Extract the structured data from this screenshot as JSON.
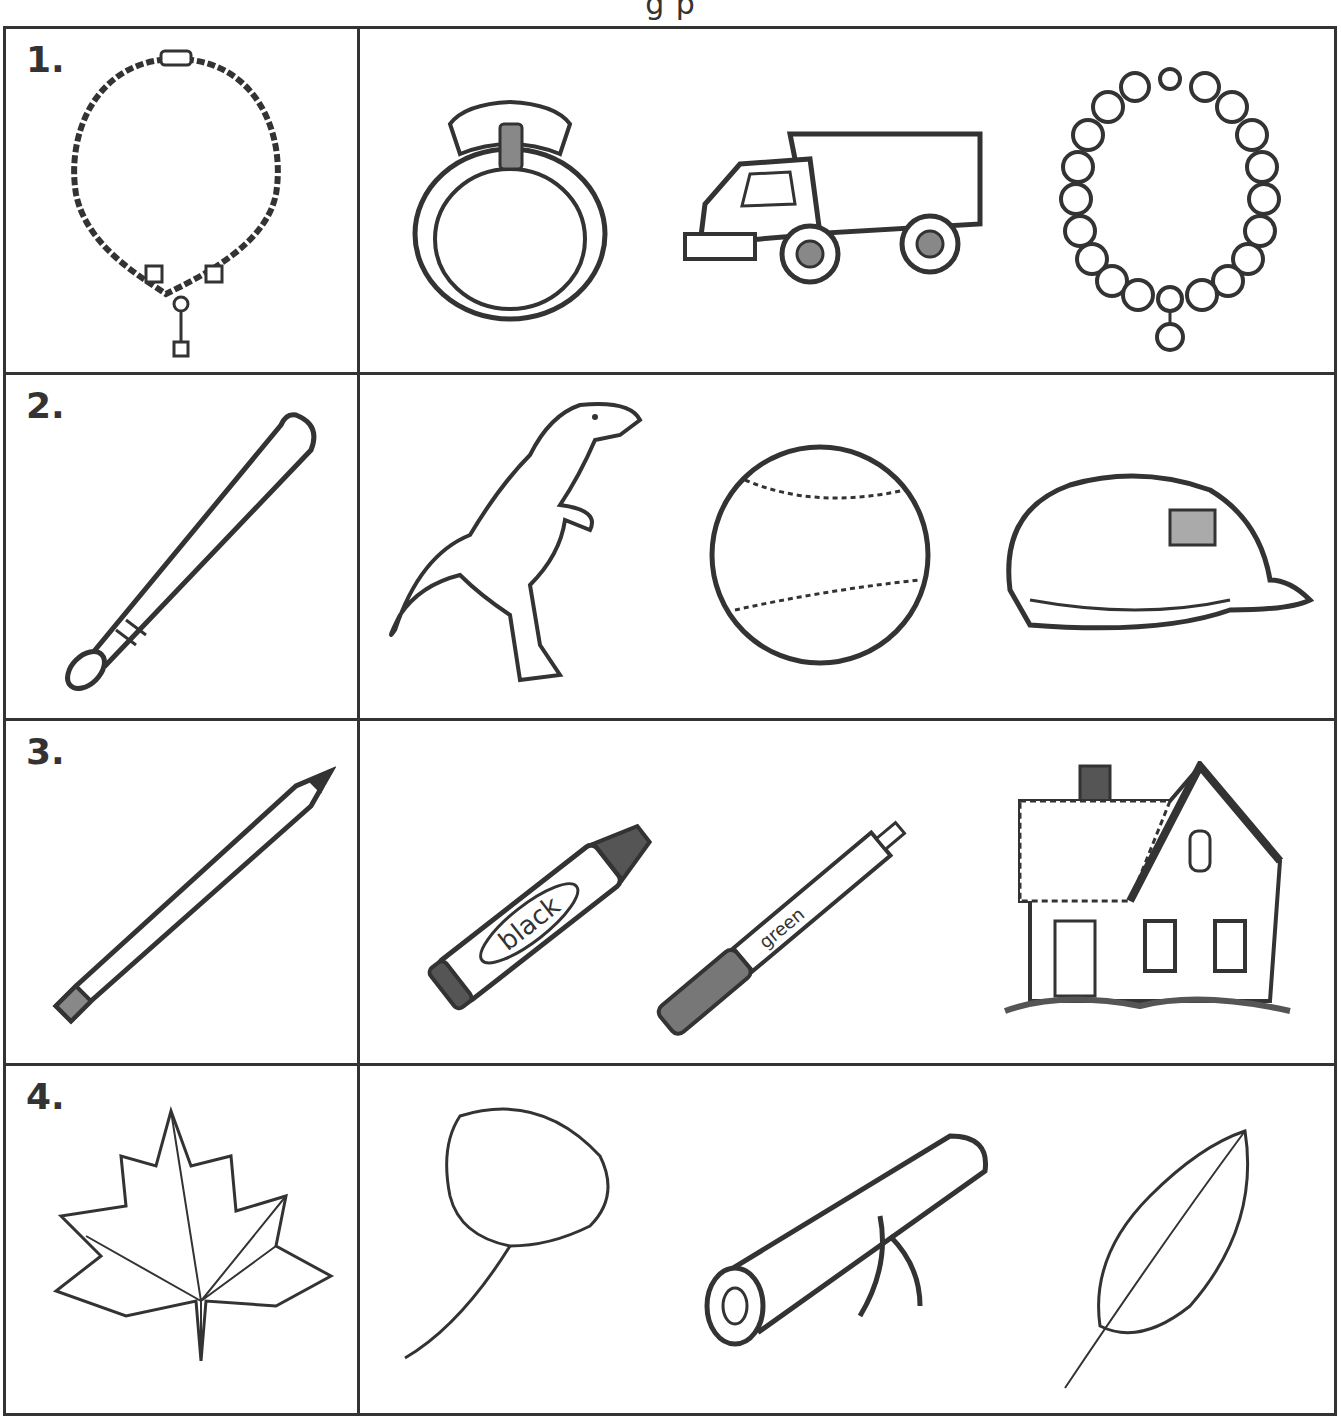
{
  "header": {
    "partial_text": "g                                         p"
  },
  "rows": [
    {
      "number": "1.",
      "target": {
        "name": "necklace",
        "icon": "necklace-icon"
      },
      "choices": [
        {
          "name": "ring",
          "icon": "ring-icon"
        },
        {
          "name": "dump truck",
          "icon": "dump-truck-icon"
        },
        {
          "name": "bead bracelet",
          "icon": "bracelet-icon"
        }
      ]
    },
    {
      "number": "2.",
      "target": {
        "name": "baseball bat",
        "icon": "baseball-bat-icon"
      },
      "choices": [
        {
          "name": "dinosaur",
          "icon": "dinosaur-icon"
        },
        {
          "name": "baseball",
          "icon": "baseball-icon"
        },
        {
          "name": "baseball cap",
          "icon": "cap-icon"
        }
      ]
    },
    {
      "number": "3.",
      "target": {
        "name": "pencil",
        "icon": "pencil-icon"
      },
      "choices": [
        {
          "name": "crayon",
          "icon": "crayon-icon",
          "label": "black"
        },
        {
          "name": "marker",
          "icon": "marker-icon",
          "label": "green"
        },
        {
          "name": "house",
          "icon": "house-icon"
        }
      ]
    },
    {
      "number": "4.",
      "target": {
        "name": "maple leaf",
        "icon": "maple-leaf-icon"
      },
      "choices": [
        {
          "name": "ginkgo leaf",
          "icon": "ginkgo-leaf-icon"
        },
        {
          "name": "log",
          "icon": "log-icon"
        },
        {
          "name": "leaf",
          "icon": "leaf-icon"
        }
      ]
    }
  ],
  "colors": {
    "line": "#333333",
    "fill_dark": "#555555",
    "fill_mid": "#888888",
    "background": "#ffffff"
  }
}
